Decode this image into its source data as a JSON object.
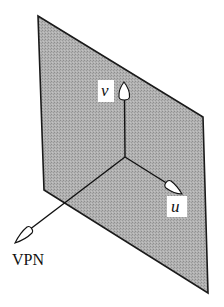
{
  "diagram": {
    "plane": {
      "fill": "#a9a9a9",
      "stroke": "#1a1a1a",
      "vertices": [
        [
          38,
          16
        ],
        [
          203,
          117
        ],
        [
          208,
          293
        ],
        [
          44,
          190
        ]
      ]
    },
    "origin": [
      125,
      157
    ],
    "axes": {
      "v": {
        "label": "v",
        "tip": [
          124,
          82
        ],
        "label_box": [
          98,
          80,
          16,
          22
        ]
      },
      "u": {
        "label": "u",
        "tip": [
          182,
          194
        ],
        "label_box": [
          167,
          196,
          20,
          21
        ]
      },
      "vpn": {
        "label": "VPN",
        "tip": [
          15,
          243
        ],
        "label_pos": [
          13,
          265
        ]
      }
    },
    "colors": {
      "line": "#111111",
      "arrowhead_fill": "#ffffff",
      "label_box": "#ffffff"
    }
  }
}
